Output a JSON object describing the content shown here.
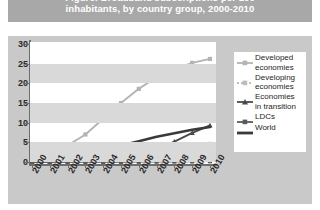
{
  "title": {
    "line1": "Figure: Broadband subscriptions per 100",
    "line2": "inhabitants, by country group, 2000-2010",
    "banner_color": "#a8a8a8",
    "text_color": "#ffffff"
  },
  "panel": {
    "background": "#c9c9c9",
    "plot_background": "#ffffff",
    "band_color": "#d9d9d9"
  },
  "legend": {
    "position": "right",
    "entries": [
      {
        "label_line1": "Developed",
        "label_line2": "economies",
        "color": "#b4b4b4",
        "marker": "line-square",
        "name": "legend-developed-economies"
      },
      {
        "label_line1": "Developing",
        "label_line2": "economies",
        "color": "#bdbdbd",
        "marker": "dotted-square",
        "name": "legend-developing-economies"
      },
      {
        "label_line1": "Economies",
        "label_line2": "in transition",
        "color": "#4a4a4a",
        "marker": "line-triangle",
        "name": "legend-economies-in-transition"
      },
      {
        "label_line1": "LDCs",
        "label_line2": "",
        "color": "#5a5a5a",
        "marker": "line-square",
        "name": "legend-ldcs"
      },
      {
        "label_line1": "World",
        "label_line2": "",
        "color": "#3a3a3a",
        "marker": "thick-line",
        "name": "legend-world"
      }
    ]
  },
  "chart_data": {
    "type": "line",
    "title": "Figure: Broadband subscriptions per 100 inhabitants, by country group, 2000-2010",
    "xlabel": "",
    "ylabel": "",
    "grid": "horizontal-bands",
    "legend_position": "right",
    "x": [
      "2000",
      "2001",
      "2002",
      "2003",
      "2004",
      "2005",
      "2006",
      "2007",
      "2008",
      "2009",
      "2010"
    ],
    "ylim": [
      0,
      30
    ],
    "yticks": [
      0,
      5,
      10,
      15,
      20,
      25,
      30
    ],
    "series": [
      {
        "name": "Developed economies",
        "color": "#b4b4b4",
        "values": [
          1.0,
          2.2,
          4.2,
          7.0,
          11.0,
          15.0,
          18.6,
          21.6,
          23.6,
          25.2,
          26.2
        ]
      },
      {
        "name": "Developing economies",
        "color": "#bdbdbd",
        "values": [
          0.1,
          0.15,
          0.3,
          0.5,
          0.8,
          1.2,
          1.7,
          2.3,
          3.0,
          3.8,
          4.6
        ]
      },
      {
        "name": "Economies in transition",
        "color": "#4a4a4a",
        "values": [
          0.05,
          0.1,
          0.2,
          0.3,
          0.5,
          0.9,
          1.6,
          3.0,
          5.2,
          7.4,
          9.3
        ]
      },
      {
        "name": "LDCs",
        "color": "#5a5a5a",
        "values": [
          0.0,
          0.0,
          0.0,
          0.0,
          0.02,
          0.03,
          0.05,
          0.08,
          0.1,
          0.15,
          0.2
        ]
      },
      {
        "name": "World",
        "color": "#3a3a3a",
        "values": [
          0.3,
          0.7,
          1.3,
          2.1,
          3.1,
          4.2,
          5.3,
          6.4,
          7.3,
          8.2,
          8.9
        ]
      }
    ]
  }
}
